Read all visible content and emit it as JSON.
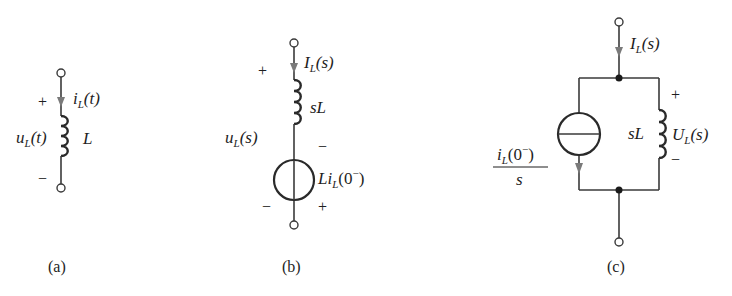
{
  "figure": {
    "panels": [
      {
        "id": "a",
        "caption": "(a)",
        "current_label": {
          "main": "i",
          "sub": "L",
          "arg": "(t)"
        },
        "voltage_label": {
          "main": "u",
          "sub": "L",
          "arg": "(t)"
        },
        "inductor_label": "L",
        "plus": "+",
        "minus": "−"
      },
      {
        "id": "b",
        "caption": "(b)",
        "current_label": {
          "main": "I",
          "sub": "L",
          "arg": "(s)"
        },
        "voltage_label": {
          "main": "u",
          "sub": "L",
          "arg": "(s)"
        },
        "impedance_label": "sL",
        "source_label": {
          "pre": "Li",
          "sub": "L",
          "arg": "(0",
          "sup": "−",
          "close": ")"
        },
        "plus_top": "+",
        "minus_bottom": "−",
        "source_minus": "−",
        "source_plus": "+"
      },
      {
        "id": "c",
        "caption": "(c)",
        "current_label": {
          "main": "I",
          "sub": "L",
          "arg": "(s)"
        },
        "voltage_label": {
          "main": "U",
          "sub": "L",
          "arg": "(s)"
        },
        "impedance_label": "sL",
        "source_label": {
          "num_main": "i",
          "num_sub": "L",
          "num_arg": "(0",
          "num_sup": "−",
          "num_close": ")",
          "den": "s"
        },
        "plus": "+",
        "minus": "−"
      }
    ]
  }
}
